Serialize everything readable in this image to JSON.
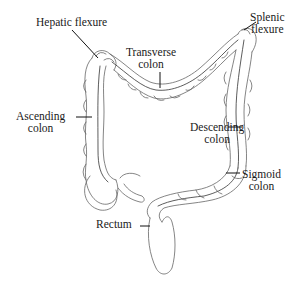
{
  "figure": {
    "labels": {
      "hepatic_flexure": "Hepatic flexure",
      "splenic_flexure": [
        "Splenic",
        "flexure"
      ],
      "transverse_colon": [
        "Transverse",
        "colon"
      ],
      "ascending_colon": [
        "Ascending",
        "colon"
      ],
      "descending_colon": [
        "Descending",
        "colon"
      ],
      "sigmoid_colon": [
        "Sigmoid",
        "colon"
      ],
      "rectum": "Rectum"
    },
    "colors": {
      "line": "#555555",
      "leader": "#111111",
      "text": "#1a1a1a",
      "background": "#ffffff"
    }
  }
}
